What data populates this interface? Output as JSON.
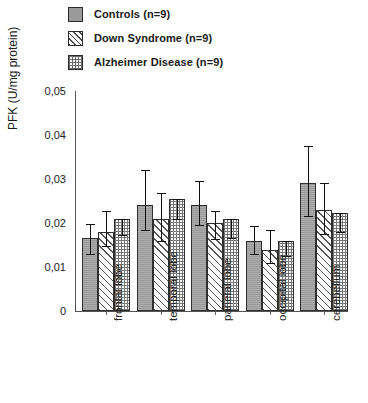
{
  "chart_data": {
    "type": "bar",
    "title": "",
    "xlabel": "",
    "ylabel": "PFK (U/mg protein)",
    "ylim": [
      0,
      0.05
    ],
    "ytick_labels": [
      "0,05",
      "0,04",
      "0,03",
      "0,02",
      "0,01",
      "0"
    ],
    "ytick_values": [
      0.05,
      0.04,
      0.03,
      0.02,
      0.01,
      0
    ],
    "grid": false,
    "legend_position": "top-left",
    "categories": [
      "frontal lobe",
      "temporal lobe",
      "parietal lobe",
      "occipital lobe",
      "cerebellum"
    ],
    "series": [
      {
        "name": "Controls (n=9)",
        "pattern": "solid-gray",
        "values": [
          0.0165,
          0.024,
          0.024,
          0.016,
          0.029
        ],
        "err_low": [
          0.013,
          0.0185,
          0.0195,
          0.013,
          0.0215
        ],
        "err_high": [
          0.0197,
          0.032,
          0.0295,
          0.0193,
          0.0375
        ]
      },
      {
        "name": "Down Syndrome (n=9)",
        "pattern": "diagonal-hatch",
        "values": [
          0.018,
          0.021,
          0.02,
          0.0138,
          0.023
        ],
        "err_low": [
          0.0147,
          0.016,
          0.0163,
          0.0108,
          0.0175
        ],
        "err_high": [
          0.0227,
          0.0268,
          0.0228,
          0.0183,
          0.029
        ]
      },
      {
        "name": "Alzheimer Disease (n=9)",
        "pattern": "crosshatch",
        "values": [
          0.021,
          0.0255,
          0.021,
          0.016,
          0.0222
        ],
        "err_low": [
          0.0172,
          0.0208,
          0.0165,
          0.0125,
          0.018
        ]
      }
    ]
  },
  "legend": {
    "items": [
      {
        "label": "Controls (n=9)",
        "swatch": "solid-gray-swatch"
      },
      {
        "label": "Down Syndrome (n=9)",
        "swatch": "diagonal-hatch-swatch"
      },
      {
        "label": "Alzheimer Disease (n=9)",
        "swatch": "crosshatch-swatch"
      }
    ]
  },
  "colors": {
    "controls_fill": "#9a9a9a",
    "hatch_line": "#555555",
    "cross_line": "#777777",
    "axis": "#555555",
    "text": "#1a1a1a"
  }
}
